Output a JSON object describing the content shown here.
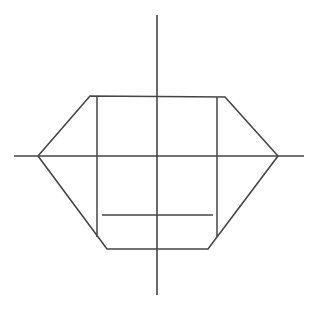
{
  "figure": {
    "canvas": {
      "width": 317,
      "height": 309,
      "background": "#ffffff"
    },
    "stroke": {
      "color": "#454545",
      "axis_width": 1.6,
      "outline_width": 1.6,
      "grid_width": 1.5
    },
    "axes": {
      "origin": {
        "x": 157,
        "y": 156
      },
      "horizontal": {
        "label": "horizontal-axis",
        "x1": 14,
        "y1": 156,
        "x2": 304,
        "y2": 156
      },
      "vertical": {
        "label": "vertical-axis",
        "x1": 157,
        "y1": 15,
        "x2": 157,
        "y2": 295
      }
    },
    "outline": {
      "label": "hexagon-outline",
      "points": "38,156 90,96 225,97 278,156 208,249 107,249 38,156",
      "vertices": [
        {
          "name": "left-vertex",
          "x": 38,
          "y": 156
        },
        {
          "name": "upper-left-vertex",
          "x": 90,
          "y": 96
        },
        {
          "name": "upper-right-vertex",
          "x": 225,
          "y": 97
        },
        {
          "name": "right-vertex",
          "x": 278,
          "y": 156
        },
        {
          "name": "lower-right-vertex",
          "x": 208,
          "y": 249
        },
        {
          "name": "lower-left-vertex",
          "x": 107,
          "y": 249
        }
      ]
    },
    "grid": [
      {
        "name": "interior-vertical-left",
        "x1": 97,
        "y1": 96,
        "x2": 97,
        "y2": 237
      },
      {
        "name": "interior-vertical-right",
        "x1": 217,
        "y1": 97,
        "x2": 217,
        "y2": 237
      },
      {
        "name": "interior-horizontal-lower",
        "x1": 102,
        "y1": 215,
        "x2": 213,
        "y2": 215
      }
    ]
  },
  "chart_data": {
    "type": "line",
    "xlabel": "",
    "ylabel": "",
    "xlim": [
      -143,
      147
    ],
    "ylim": [
      -139,
      141
    ],
    "grid": false,
    "legend": "none",
    "series": [
      {
        "name": "hexagon-outline",
        "x": [
          -119,
          -67,
          68,
          121,
          51,
          -50,
          -119
        ],
        "y": [
          0,
          60,
          59,
          0,
          -93,
          -93,
          0
        ]
      },
      {
        "name": "interior-vertical-left",
        "x": [
          -60,
          -60
        ],
        "y": [
          60,
          -81
        ]
      },
      {
        "name": "interior-vertical-right",
        "x": [
          60,
          60
        ],
        "y": [
          59,
          -81
        ]
      },
      {
        "name": "interior-horizontal-lower",
        "x": [
          -55,
          56
        ],
        "y": [
          -59,
          -59
        ]
      },
      {
        "name": "horizontal-axis",
        "x": [
          -143,
          147
        ],
        "y": [
          0,
          0
        ]
      },
      {
        "name": "vertical-axis",
        "x": [
          0,
          0
        ],
        "y": [
          141,
          -139
        ]
      }
    ]
  }
}
